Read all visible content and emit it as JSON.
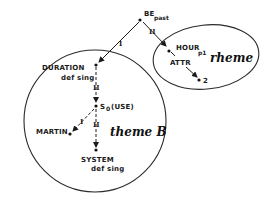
{
  "diagram": {
    "type": "semantic-network",
    "colors": {
      "ink": "#1a1a1a",
      "background": "#ffffff"
    },
    "nodes": [
      {
        "id": "be",
        "label": "BE",
        "subscript": "past"
      },
      {
        "id": "duration",
        "label": "DURATION",
        "sublabel": "def sing"
      },
      {
        "id": "s0",
        "label": "S",
        "subscript": "0",
        "suffix": "(USE)"
      },
      {
        "id": "martin",
        "label": "MARTIN"
      },
      {
        "id": "system",
        "label": "SYSTEM",
        "sublabel": "def sing"
      },
      {
        "id": "hour",
        "label": "HOUR",
        "subscript": "p1"
      },
      {
        "id": "two",
        "label": "2"
      }
    ],
    "edges": [
      {
        "from": "be",
        "to": "duration",
        "label": "I"
      },
      {
        "from": "be",
        "to": "hour",
        "label": "II"
      },
      {
        "from": "duration",
        "to": "s0",
        "label": "II"
      },
      {
        "from": "s0",
        "to": "martin",
        "label": "I"
      },
      {
        "from": "s0",
        "to": "system",
        "label": "II"
      },
      {
        "from": "hour",
        "to": "two",
        "label": "ATTR"
      }
    ],
    "regions": [
      {
        "id": "theme",
        "label": "theme B"
      },
      {
        "id": "rheme",
        "label": "rheme"
      }
    ]
  }
}
